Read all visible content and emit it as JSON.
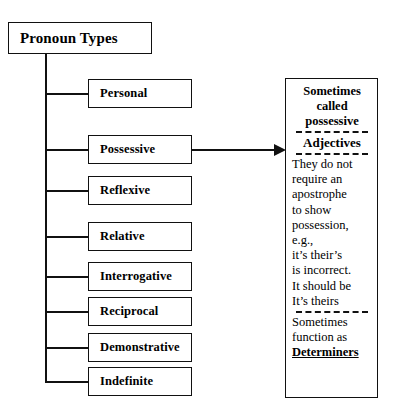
{
  "diagram": {
    "root": {
      "label": "Pronoun Types"
    },
    "children": [
      {
        "label": "Personal"
      },
      {
        "label": "Possessive"
      },
      {
        "label": "Reflexive"
      },
      {
        "label": "Relative"
      },
      {
        "label": "Interrogative"
      },
      {
        "label": "Reciprocal"
      },
      {
        "label": "Demonstrative"
      },
      {
        "label": "Indefinite"
      }
    ],
    "annotation_panel": {
      "head_line_1": "Sometimes",
      "head_line_2": "called",
      "head_line_3": "possessive",
      "subhead": "Adjectives",
      "body_lines": [
        "They do not",
        "require an",
        "apostrophe",
        "to show",
        "possession,",
        "e.g.,",
        "it’s their’s",
        "is incorrect.",
        "It should be",
        "It’s theirs"
      ],
      "footer_line_1": "Sometimes",
      "footer_line_2": "function as",
      "footer_emphasis": "Determiners"
    },
    "colors": {
      "background": "#ffffff",
      "stroke": "#111111",
      "text": "#000000"
    }
  }
}
